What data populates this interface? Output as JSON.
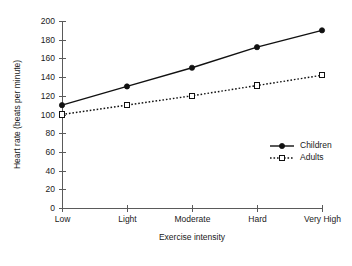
{
  "chart_data": {
    "type": "line",
    "title": "",
    "xlabel": "Exercise intensity",
    "ylabel": "Heart rate (beats per minute)",
    "categories": [
      "Low",
      "Light",
      "Moderate",
      "Hard",
      "Very High"
    ],
    "ylim": [
      0,
      200
    ],
    "yticks": [
      0,
      20,
      40,
      60,
      80,
      100,
      120,
      140,
      160,
      180,
      200
    ],
    "grid": false,
    "legend_position": "inside-right",
    "series": [
      {
        "name": "Children",
        "values": [
          110,
          130,
          150,
          172,
          190
        ],
        "line_style": "solid",
        "marker": "filled-circle",
        "color": "#111111"
      },
      {
        "name": "Adults",
        "values": [
          100,
          110,
          120,
          131,
          142
        ],
        "line_style": "dotted",
        "marker": "open-square",
        "color": "#111111"
      }
    ]
  },
  "legend": {
    "entries": [
      {
        "label": "Children"
      },
      {
        "label": "Adults"
      }
    ]
  },
  "axes": {
    "y_title": "Heart rate (beats per minute)",
    "x_title": "Exercise intensity"
  }
}
